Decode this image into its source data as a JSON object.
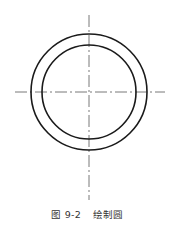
{
  "figure": {
    "center": {
      "x": 89,
      "y": 92
    },
    "outer_circle_radius": 58,
    "inner_circle_radius": 47,
    "stroke_color": "#1a1a1a",
    "centerline_color": "#555555",
    "vertical_centerline": {
      "y1": 15,
      "y2": 202
    },
    "horizontal_centerline": {
      "x1": 15,
      "x2": 165
    }
  },
  "caption": {
    "number": "图 9-2",
    "title": "绘制圆"
  }
}
